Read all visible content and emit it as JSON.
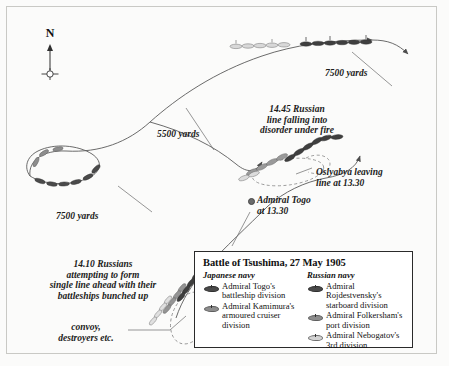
{
  "map": {
    "compass": {
      "north_label": "N",
      "icon": "compass-rose-icon"
    },
    "distance_labels": [
      {
        "id": "d1",
        "text": "7500 yards"
      },
      {
        "id": "d2",
        "text": "5500 yards"
      },
      {
        "id": "d3",
        "text": "7500 yards"
      }
    ],
    "annotations": [
      {
        "id": "a1",
        "text": "14.45 Russian\nline falling into\ndisorder under fire"
      },
      {
        "id": "a2",
        "text": "Oslyabya leaving\nline at 13.30"
      },
      {
        "id": "a3",
        "text": "Admiral Togo\nat 13.30"
      },
      {
        "id": "a4",
        "text": "14.10 Russians\nattempting to form\nsingle line ahead with their\nbattleships bunched up"
      },
      {
        "id": "a5",
        "text": "convoy,\ndestroyers etc."
      }
    ]
  },
  "legend": {
    "title": "Battle of Tsushima, 27 May 1905",
    "columns": [
      {
        "heading": "Japanese navy",
        "entries": [
          {
            "symbol": "dark",
            "label": "Admiral Togo's\nbattleship division"
          },
          {
            "symbol": "mid",
            "label": "Admiral Kamimura's\narmoured cruiser\ndivision"
          }
        ]
      },
      {
        "heading": "Russian navy",
        "entries": [
          {
            "symbol": "dark",
            "label": "Admiral Rojdestvensky's\nstarboard division"
          },
          {
            "symbol": "mid",
            "label": "Admiral Folkersham's\nport division"
          },
          {
            "symbol": "light",
            "label": "Admiral Nebogatov's\n3rd division"
          }
        ]
      }
    ]
  },
  "colors": {
    "background": "#fbfbfa",
    "frame": "#c9c9c5",
    "ink": "#1b1b1b",
    "track": "#5a5a5a",
    "ship_dark": "#4a4a4a",
    "ship_mid": "#8d8d8d",
    "ship_light": "#d3d3d3",
    "legend_border": "#2a2a2a"
  }
}
